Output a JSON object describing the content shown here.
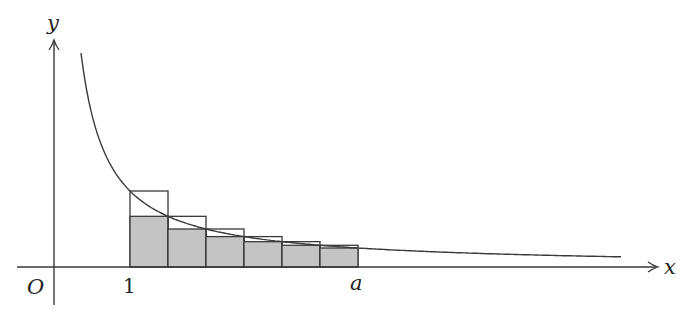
{
  "figure": {
    "function": "1/x",
    "interval": [
      1,
      4
    ],
    "subdivisions": 6,
    "colors": {
      "stroke": "#3a3a3a",
      "shaded_fill": "#c4c4c4",
      "background": "#ffffff"
    },
    "labels": {
      "x_axis": "x",
      "y_axis": "y",
      "origin": "O",
      "tick_one": "1",
      "tick_a": "a"
    }
  }
}
